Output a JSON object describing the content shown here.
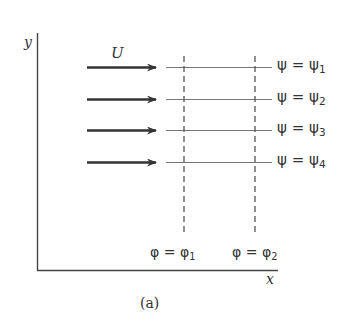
{
  "figure": {
    "caption": "(a)",
    "axes": {
      "x_label": "x",
      "y_label": "y"
    },
    "velocity": {
      "label": "U",
      "arrow_count": 4
    },
    "streamlines": [
      {
        "symbol": "ψ",
        "eq": " = ",
        "sym2": "ψ",
        "sub": "1"
      },
      {
        "symbol": "ψ",
        "eq": " = ",
        "sym2": "ψ",
        "sub": "2"
      },
      {
        "symbol": "ψ",
        "eq": " = ",
        "sym2": "ψ",
        "sub": "3"
      },
      {
        "symbol": "ψ",
        "eq": " = ",
        "sym2": "ψ",
        "sub": "4"
      }
    ],
    "potential_lines": [
      {
        "symbol": "φ",
        "eq": " = ",
        "sym2": "φ",
        "sub": "1"
      },
      {
        "symbol": "φ",
        "eq": " = ",
        "sym2": "φ",
        "sub": "2"
      }
    ],
    "colors": {
      "axis": "#444444",
      "arrow": "#333333",
      "streamline": "#777777",
      "potential": "#555555",
      "text": "#333333"
    }
  }
}
